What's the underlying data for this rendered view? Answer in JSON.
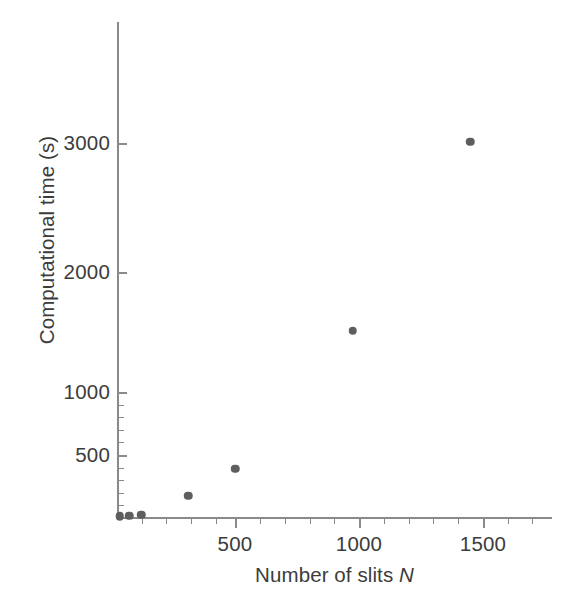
{
  "chart_data": {
    "type": "scatter",
    "title": "",
    "xlabel": "Number of slits N",
    "xlabel_plain": "Number of slits ",
    "xlabel_symbol": "N",
    "ylabel": "Computational time (s)",
    "x": [
      10,
      50,
      100,
      300,
      500,
      1000,
      1500
    ],
    "values": [
      5,
      10,
      20,
      170,
      390,
      1510,
      3010
    ],
    "points": [
      {
        "x": 10,
        "y": 5
      },
      {
        "x": 50,
        "y": 10
      },
      {
        "x": 100,
        "y": 20
      },
      {
        "x": 300,
        "y": 170
      },
      {
        "x": 500,
        "y": 390
      },
      {
        "x": 1000,
        "y": 1510
      },
      {
        "x": 1500,
        "y": 3010
      }
    ],
    "xticks": [
      500,
      1000,
      1500
    ],
    "xtick_labels": [
      "500",
      "1000",
      "1500"
    ],
    "yticks": [
      500,
      1000,
      2000,
      3000
    ],
    "ytick_labels": [
      "500",
      "1000",
      "2000",
      "3000"
    ],
    "xlim": [
      0,
      1780
    ],
    "ylim": [
      0,
      3500
    ],
    "grid": false,
    "legend": null,
    "marker_color": "#5e5e5e",
    "axis_color": "#8a8a8a",
    "text_color": "#3c3c3c",
    "background": "#ffffff"
  },
  "axis": {
    "y_title": "Computational time (s)",
    "x_title_text": "Number of slits ",
    "x_title_symbol": "N",
    "ytick_3000": "3000",
    "ytick_2000": "2000",
    "ytick_1000": "1000",
    "ytick_500": "500",
    "xtick_500": "500",
    "xtick_1000": "1000",
    "xtick_1500": "1500"
  }
}
